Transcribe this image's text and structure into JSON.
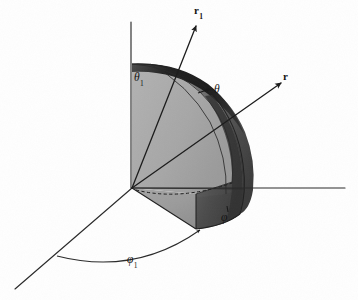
{
  "figure": {
    "type": "3d-geometry-diagram",
    "background_color": "#fefefe",
    "ink_color": "#1d1d1d",
    "width": 358,
    "height": 300
  },
  "labels": {
    "vector_r1": {
      "symbol": "r",
      "subscript": "1",
      "x": 194,
      "y": 5
    },
    "vector_r": {
      "symbol": "r",
      "subscript": "",
      "x": 283,
      "y": 71
    },
    "angle_theta1": {
      "symbol": "θ",
      "subscript": "1",
      "x": 134,
      "y": 72
    },
    "angle_theta": {
      "symbol": "θ",
      "subscript": "",
      "x": 214,
      "y": 85
    },
    "angle_phi": {
      "symbol": "φ",
      "subscript": "",
      "x": 222,
      "y": 213
    },
    "angle_phi1": {
      "symbol": "φ",
      "subscript": "1",
      "x": 127,
      "y": 255
    }
  },
  "geometry": {
    "origin": {
      "x": 132,
      "y": 188
    },
    "axis_vertical_top": {
      "x": 131,
      "y": 22
    },
    "axis_horizontal_right": {
      "x": 345,
      "y": 188
    },
    "axis_front_left": {
      "x": 15,
      "y": 289
    },
    "vector_r1_tip": {
      "x": 196,
      "y": 24
    },
    "vector_r_tip": {
      "x": 281,
      "y": 82
    },
    "shell_outer_radius": 126,
    "shell_inner_radius": 112,
    "phi_arc_start": {
      "x": 57,
      "y": 256
    },
    "phi_arc_end": {
      "x": 237,
      "y": 218
    }
  },
  "shading": {
    "flat_face_left": "#a9a9a9",
    "curved_surface_mid": "#5d5d5d",
    "curved_surface_dark": "#333333",
    "shell_band_dark": "#262626",
    "base_wedge": "#9b9b9b",
    "base_wedge_light": "#b2b2b2"
  },
  "elements": {
    "vertical_axis": "vertical-axis",
    "horizontal_axis": "horizontal-axis",
    "front_axis": "front-left-axis",
    "radial_vector_1": "radial-vector-r1",
    "radial_vector": "radial-vector-r",
    "spherical_wedge": "spherical-wedge-solid",
    "phi_arc": "phi1-azimuth-arc",
    "theta_arc": "theta-polar-arc",
    "base_triangle": "base-sector-triangle",
    "hidden_edge": "hidden-dashed-edge"
  }
}
